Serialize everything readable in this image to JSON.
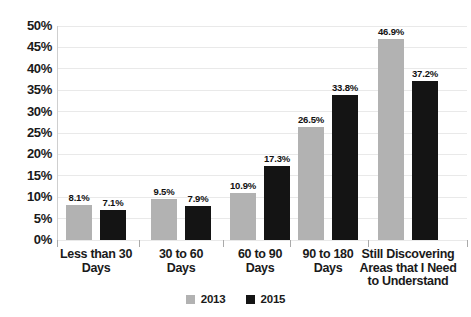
{
  "chart_data": {
    "type": "bar",
    "title": "",
    "xlabel": "",
    "ylabel": "",
    "categories": [
      "Less than 30 Days",
      "30 to 60 Days",
      "60 to 90 Days",
      "90 to 180 Days",
      "Still Discovering Areas that I Need to Understand"
    ],
    "category_label_lines": [
      [
        "Less than 30",
        "Days"
      ],
      [
        "30 to 60",
        "Days"
      ],
      [
        "60 to 90",
        "Days"
      ],
      [
        "90 to 180",
        "Days"
      ],
      [
        "Still Discovering",
        "Areas that I Need",
        "to Understand"
      ]
    ],
    "series": [
      {
        "name": "2013",
        "color": "#b2b2b2",
        "values": [
          8.1,
          9.5,
          10.9,
          26.5,
          46.9
        ],
        "value_labels": [
          "8.1%",
          "9.5%",
          "10.9%",
          "26.5%",
          "46.9%"
        ]
      },
      {
        "name": "2015",
        "color": "#141414",
        "values": [
          7.1,
          7.9,
          17.3,
          33.8,
          37.2
        ],
        "value_labels": [
          "7.1%",
          "7.9%",
          "17.3%",
          "33.8%",
          "37.2%"
        ]
      }
    ],
    "y_ticks": [
      "0%",
      "5%",
      "10%",
      "15%",
      "20%",
      "25%",
      "30%",
      "35%",
      "40%",
      "45%",
      "50%"
    ],
    "ylim": [
      0,
      50
    ],
    "grid": true,
    "legend_position": "bottom-center"
  },
  "colors": {
    "background": "#ffffff",
    "gridline": "#e9e9e9",
    "axis_line": "#cfcfcf",
    "tick": "#aaaaaa",
    "text": "#1a1a1a"
  }
}
